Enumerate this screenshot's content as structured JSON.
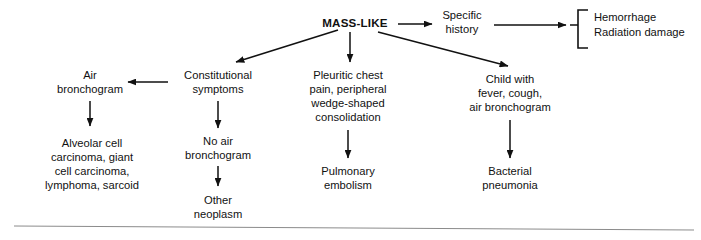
{
  "diagram": {
    "background_color": "#ffffff",
    "text_color": "#111111",
    "line_color": "#111111",
    "rule_color": "#8b8b8b",
    "nodes": {
      "root": {
        "label": "MASS-LIKE",
        "x": 355,
        "y": 24
      },
      "specific_history": {
        "line1": "Specific",
        "line2": "history",
        "x": 462,
        "y": 22
      },
      "hemorrhage": {
        "line1": "Hemorrhage",
        "line2": "Radiation damage",
        "x": 592,
        "y": 24
      },
      "air_bronchogram": {
        "line1": "Air",
        "line2": "bronchogram",
        "x": 90,
        "y": 80
      },
      "alveolar": {
        "line1": "Alveolar cell",
        "line2": "carcinoma, giant",
        "line3": "cell carcinoma,",
        "line4": "lymphoma, sarcoid",
        "x": 92,
        "y": 152
      },
      "constitutional": {
        "line1": "Constitutional",
        "line2": "symptoms",
        "x": 218,
        "y": 80
      },
      "no_air_bronchogram": {
        "line1": "No air",
        "line2": "bronchogram",
        "x": 218,
        "y": 146
      },
      "other_neoplasm": {
        "line1": "Other",
        "line2": "neoplasm",
        "x": 218,
        "y": 198
      },
      "pleuritic": {
        "line1": "Pleuritic chest",
        "line2": "pain, peripheral",
        "line3": "wedge-shaped",
        "line4": "consolidation",
        "x": 348,
        "y": 88
      },
      "pulmonary_embolism": {
        "line1": "Pulmonary",
        "line2": "embolism",
        "x": 348,
        "y": 177
      },
      "child_with_fever": {
        "line1": "Child with",
        "line2": "fever, cough,",
        "line3": "air bronchogram",
        "x": 510,
        "y": 85
      },
      "bacterial_pneumonia": {
        "line1": "Bacterial",
        "line2": "pneumonia",
        "x": 510,
        "y": 177
      }
    },
    "edges": [
      {
        "name": "root-to-specific-history",
        "from": "root",
        "to": "specific_history"
      },
      {
        "name": "specific-history-to-bracket",
        "from": "specific_history",
        "to": "hemorrhage"
      },
      {
        "name": "root-to-constitutional",
        "from": "root",
        "to": "constitutional"
      },
      {
        "name": "root-to-pleuritic",
        "from": "root",
        "to": "pleuritic"
      },
      {
        "name": "root-to-child",
        "from": "root",
        "to": "child_with_fever"
      },
      {
        "name": "constitutional-to-air-bronchogram",
        "from": "constitutional",
        "to": "air_bronchogram"
      },
      {
        "name": "air-bronchogram-to-alveolar",
        "from": "air_bronchogram",
        "to": "alveolar"
      },
      {
        "name": "constitutional-to-no-air",
        "from": "constitutional",
        "to": "no_air_bronchogram"
      },
      {
        "name": "no-air-to-other-neoplasm",
        "from": "no_air_bronchogram",
        "to": "other_neoplasm"
      },
      {
        "name": "pleuritic-to-pulmonary-embolism",
        "from": "pleuritic",
        "to": "pulmonary_embolism"
      },
      {
        "name": "child-to-bacterial-pneumonia",
        "from": "child_with_fever",
        "to": "bacterial_pneumonia"
      }
    ]
  }
}
